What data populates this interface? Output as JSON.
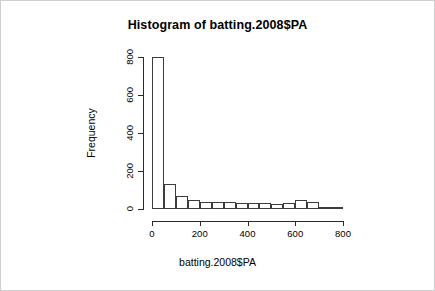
{
  "chart_data": {
    "type": "bar",
    "title": "Histogram of batting.2008$PA",
    "xlabel": "batting.2008$PA",
    "ylabel": "Frequency",
    "xlim": [
      0,
      800
    ],
    "ylim": [
      0,
      800
    ],
    "grid": false,
    "legend": null,
    "binwidth": 50,
    "xticks": [
      {
        "value": 0,
        "label": "0"
      },
      {
        "value": 200,
        "label": "200"
      },
      {
        "value": 400,
        "label": "400"
      },
      {
        "value": 600,
        "label": "600"
      },
      {
        "value": 800,
        "label": "800"
      }
    ],
    "yticks": [
      {
        "value": 0,
        "label": "0"
      },
      {
        "value": 200,
        "label": "200"
      },
      {
        "value": 400,
        "label": "400"
      },
      {
        "value": 600,
        "label": "600"
      },
      {
        "value": 800,
        "label": "800"
      }
    ],
    "bins": [
      {
        "x0": 0,
        "x1": 50,
        "value": 800
      },
      {
        "x0": 50,
        "x1": 100,
        "value": 130
      },
      {
        "x0": 100,
        "x1": 150,
        "value": 70
      },
      {
        "x0": 150,
        "x1": 200,
        "value": 50
      },
      {
        "x0": 200,
        "x1": 250,
        "value": 38
      },
      {
        "x0": 250,
        "x1": 300,
        "value": 35
      },
      {
        "x0": 300,
        "x1": 350,
        "value": 36
      },
      {
        "x0": 350,
        "x1": 400,
        "value": 34
      },
      {
        "x0": 400,
        "x1": 450,
        "value": 34
      },
      {
        "x0": 450,
        "x1": 500,
        "value": 34
      },
      {
        "x0": 500,
        "x1": 550,
        "value": 26
      },
      {
        "x0": 550,
        "x1": 600,
        "value": 34
      },
      {
        "x0": 600,
        "x1": 650,
        "value": 50
      },
      {
        "x0": 650,
        "x1": 700,
        "value": 36
      },
      {
        "x0": 700,
        "x1": 750,
        "value": 10
      },
      {
        "x0": 750,
        "x1": 800,
        "value": 4
      }
    ],
    "categories": [
      "0-50",
      "50-100",
      "100-150",
      "150-200",
      "200-250",
      "250-300",
      "300-350",
      "350-400",
      "400-450",
      "450-500",
      "500-550",
      "550-600",
      "600-650",
      "650-700",
      "700-750",
      "750-800"
    ],
    "values": [
      800,
      130,
      70,
      50,
      38,
      35,
      36,
      34,
      34,
      34,
      26,
      34,
      50,
      36,
      10,
      4
    ],
    "colors": {
      "bar_fill": "#ffffff",
      "bar_stroke": "#3c3c3c",
      "axis": "#2b2b2b",
      "text": "#000000",
      "background": "#ffffff",
      "image_border": "#cfcfcf"
    }
  }
}
